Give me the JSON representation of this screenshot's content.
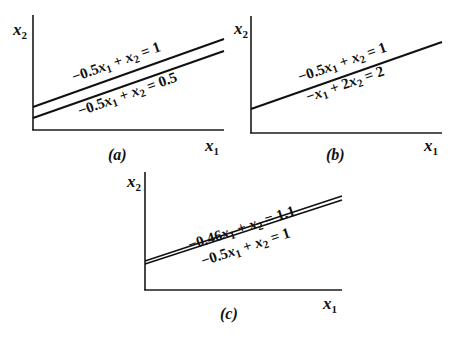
{
  "panels": [
    {
      "id": "a",
      "caption": "(a)",
      "x_axis_label": "x",
      "x_axis_sub": "1",
      "y_axis_label": "x",
      "y_axis_sub": "2",
      "equations": [
        {
          "coef1": "−0.5",
          "var1": "x",
          "sub1": "1",
          "op": " + ",
          "var2": "x",
          "sub2": "2",
          "rhs": " = 1"
        },
        {
          "coef1": "−0.5",
          "var1": "x",
          "sub1": "1",
          "op": " + ",
          "var2": "x",
          "sub2": "2",
          "rhs": " = 0.5"
        }
      ]
    },
    {
      "id": "b",
      "caption": "(b)",
      "x_axis_label": "x",
      "x_axis_sub": "1",
      "y_axis_label": "x",
      "y_axis_sub": "2",
      "equations": [
        {
          "coef1": "−0.5",
          "var1": "x",
          "sub1": "1",
          "op": " + ",
          "var2": "x",
          "sub2": "2",
          "rhs": " = 1"
        },
        {
          "coef1": "−",
          "var1": "x",
          "sub1": "1",
          "op": " + 2",
          "var2": "x",
          "sub2": "2",
          "rhs": " = 2"
        }
      ]
    },
    {
      "id": "c",
      "caption": "(c)",
      "x_axis_label": "x",
      "x_axis_sub": "1",
      "y_axis_label": "x",
      "y_axis_sub": "2",
      "equations": [
        {
          "coef1": "−0.46",
          "var1": "x",
          "sub1": "1",
          "op": " + ",
          "var2": "x",
          "sub2": "2",
          "rhs": " = 1.1"
        },
        {
          "coef1": "−0.5",
          "var1": "x",
          "sub1": "1",
          "op": " + ",
          "var2": "x",
          "sub2": "2",
          "rhs": " = 1"
        }
      ]
    }
  ]
}
